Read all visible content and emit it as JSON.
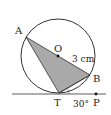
{
  "diagram": {
    "type": "geometry",
    "circle": {
      "cx": 58,
      "cy": 56,
      "r": 37,
      "stroke": "#333333"
    },
    "points": {
      "A": {
        "label": "A",
        "x": 26,
        "y": 37
      },
      "O": {
        "label": "O",
        "x": 58,
        "y": 56
      },
      "B": {
        "label": "B",
        "x": 90,
        "y": 75
      },
      "T": {
        "label": "T",
        "x": 59,
        "y": 93
      },
      "P": {
        "label": "P",
        "x": 96,
        "y": 94
      }
    },
    "radius_label": "3 cm",
    "angle_label": "30°",
    "triangle_fill": "#a9a9a9",
    "tangent_line": {
      "x1": 12,
      "y1": 94,
      "x2": 106,
      "y2": 94
    }
  }
}
